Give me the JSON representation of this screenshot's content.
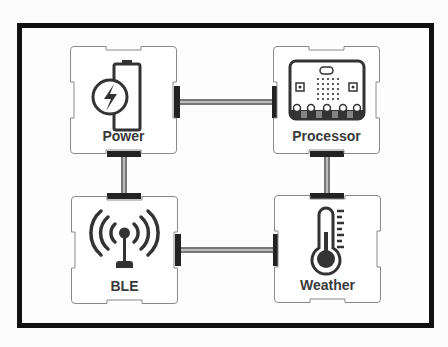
{
  "diagram": {
    "type": "block-connection-diagram",
    "colors": {
      "frame": "#111111",
      "module_border": "#8a8a8a",
      "module_fill": "#ffffff",
      "icon": "#333333",
      "connector": "#222222",
      "wire": "#555555"
    },
    "modules": [
      {
        "id": "power",
        "label": "Power",
        "icon": "battery-charging-icon"
      },
      {
        "id": "processor",
        "label": "Processor",
        "icon": "microbit-board-icon"
      },
      {
        "id": "ble",
        "label": "BLE",
        "icon": "antenna-signal-icon"
      },
      {
        "id": "weather",
        "label": "Weather",
        "icon": "thermometer-icon"
      }
    ],
    "connections": [
      {
        "from": "Power",
        "to": "Processor"
      },
      {
        "from": "Power",
        "to": "BLE"
      },
      {
        "from": "Processor",
        "to": "Weather"
      },
      {
        "from": "BLE",
        "to": "Weather"
      }
    ]
  }
}
